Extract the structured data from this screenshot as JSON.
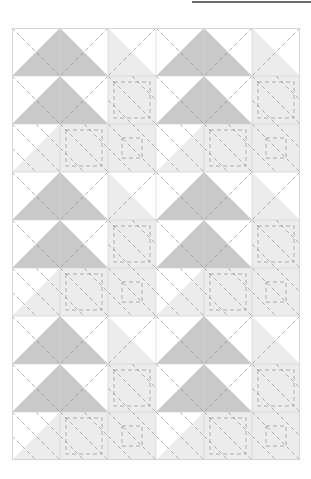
{
  "page": {
    "width": 311,
    "height": 479,
    "background": "#ffffff"
  },
  "top_rule": {
    "name": "horizontal-rule",
    "x": 192,
    "y": 1,
    "width": 119,
    "height": 2,
    "color": "#6b6b6b"
  },
  "quilt": {
    "title": "Half-Square Triangle Pinwheel Quilt Layout",
    "x": 12,
    "y": 28,
    "cell": 48,
    "cols": 6,
    "rows": 9,
    "width": 288,
    "height": 432,
    "border_color": "#d6d6d6",
    "border_width": 0.8,
    "colors": {
      "white": "#ffffff",
      "light": "#ececec",
      "medium": "#c9c9c9",
      "stitch": "#9a9a9a"
    },
    "stitch": {
      "dash": "4 3",
      "width": 0.9,
      "opacity": 0.85
    },
    "legend": {
      "white_label": "Background (white)",
      "light_label": "Light gray",
      "medium_label": "Medium gray"
    },
    "cells": [
      [
        "w|tr:m",
        "w|tl:m",
        "l|tl:l",
        "w|tr:m",
        "w|tl:m",
        "l|tl:l"
      ],
      [
        "w|br:m",
        "w|bl:m",
        "l|bl:l",
        "w|br:m",
        "w|bl:m",
        "l|bl:l"
      ],
      [
        "l|bl:l",
        "l|bl:l",
        "l|bl:l",
        "l|bl:l",
        "l|bl:l",
        "l|bl:l"
      ],
      [
        "w|tr:m",
        "w|tl:m",
        "l|tl:l",
        "w|tr:m",
        "w|tl:m",
        "l|tl:l"
      ],
      [
        "w|br:m",
        "w|bl:m",
        "l|bl:l",
        "w|br:m",
        "w|bl:m",
        "l|bl:l"
      ],
      [
        "l|bl:l",
        "l|bl:l",
        "l|bl:l",
        "l|bl:l",
        "l|bl:l",
        "l|bl:l"
      ],
      [
        "w|tr:m",
        "w|tl:m",
        "l|tl:l",
        "w|tr:m",
        "w|tl:m",
        "l|tl:l"
      ],
      [
        "w|br:m",
        "w|bl:m",
        "l|bl:l",
        "w|br:m",
        "w|bl:m",
        "l|bl:l"
      ],
      [
        "l|bl:l",
        "l|bl:l",
        "l|bl:l",
        "l|bl:l",
        "l|bl:l",
        "l|bl:l"
      ]
    ],
    "triangles": [
      {
        "row": 0,
        "col": 0,
        "corner": "br",
        "fill": "medium"
      },
      {
        "row": 0,
        "col": 1,
        "corner": "bl",
        "fill": "medium"
      },
      {
        "row": 0,
        "col": 2,
        "corner": "bl",
        "fill": "light"
      },
      {
        "row": 0,
        "col": 3,
        "corner": "br",
        "fill": "medium"
      },
      {
        "row": 0,
        "col": 4,
        "corner": "bl",
        "fill": "medium"
      },
      {
        "row": 0,
        "col": 5,
        "corner": "bl",
        "fill": "light"
      },
      {
        "row": 1,
        "col": 0,
        "corner": "br",
        "fill": "medium"
      },
      {
        "row": 1,
        "col": 1,
        "corner": "bl",
        "fill": "medium"
      },
      {
        "row": 1,
        "col": 2,
        "corner": "full",
        "fill": "light"
      },
      {
        "row": 1,
        "col": 3,
        "corner": "br",
        "fill": "medium"
      },
      {
        "row": 1,
        "col": 4,
        "corner": "bl",
        "fill": "medium"
      },
      {
        "row": 1,
        "col": 5,
        "corner": "full",
        "fill": "light"
      },
      {
        "row": 2,
        "col": 0,
        "corner": "br",
        "fill": "light"
      },
      {
        "row": 2,
        "col": 1,
        "corner": "full",
        "fill": "light"
      },
      {
        "row": 2,
        "col": 2,
        "corner": "full",
        "fill": "light"
      },
      {
        "row": 2,
        "col": 3,
        "corner": "br",
        "fill": "light"
      },
      {
        "row": 2,
        "col": 4,
        "corner": "full",
        "fill": "light"
      },
      {
        "row": 2,
        "col": 5,
        "corner": "full",
        "fill": "light"
      },
      {
        "row": 3,
        "col": 0,
        "corner": "br",
        "fill": "medium"
      },
      {
        "row": 3,
        "col": 1,
        "corner": "bl",
        "fill": "medium"
      },
      {
        "row": 3,
        "col": 2,
        "corner": "bl",
        "fill": "light"
      },
      {
        "row": 3,
        "col": 3,
        "corner": "br",
        "fill": "medium"
      },
      {
        "row": 3,
        "col": 4,
        "corner": "bl",
        "fill": "medium"
      },
      {
        "row": 3,
        "col": 5,
        "corner": "bl",
        "fill": "light"
      },
      {
        "row": 4,
        "col": 0,
        "corner": "br",
        "fill": "medium"
      },
      {
        "row": 4,
        "col": 1,
        "corner": "bl",
        "fill": "medium"
      },
      {
        "row": 4,
        "col": 2,
        "corner": "full",
        "fill": "light"
      },
      {
        "row": 4,
        "col": 3,
        "corner": "br",
        "fill": "medium"
      },
      {
        "row": 4,
        "col": 4,
        "corner": "bl",
        "fill": "medium"
      },
      {
        "row": 4,
        "col": 5,
        "corner": "full",
        "fill": "light"
      },
      {
        "row": 5,
        "col": 0,
        "corner": "br",
        "fill": "light"
      },
      {
        "row": 5,
        "col": 1,
        "corner": "full",
        "fill": "light"
      },
      {
        "row": 5,
        "col": 2,
        "corner": "full",
        "fill": "light"
      },
      {
        "row": 5,
        "col": 3,
        "corner": "br",
        "fill": "light"
      },
      {
        "row": 5,
        "col": 4,
        "corner": "full",
        "fill": "light"
      },
      {
        "row": 5,
        "col": 5,
        "corner": "full",
        "fill": "light"
      },
      {
        "row": 6,
        "col": 0,
        "corner": "br",
        "fill": "medium"
      },
      {
        "row": 6,
        "col": 1,
        "corner": "bl",
        "fill": "medium"
      },
      {
        "row": 6,
        "col": 2,
        "corner": "bl",
        "fill": "light"
      },
      {
        "row": 6,
        "col": 3,
        "corner": "br",
        "fill": "medium"
      },
      {
        "row": 6,
        "col": 4,
        "corner": "bl",
        "fill": "medium"
      },
      {
        "row": 6,
        "col": 5,
        "corner": "bl",
        "fill": "light"
      },
      {
        "row": 7,
        "col": 0,
        "corner": "br",
        "fill": "medium"
      },
      {
        "row": 7,
        "col": 1,
        "corner": "bl",
        "fill": "medium"
      },
      {
        "row": 7,
        "col": 2,
        "corner": "full",
        "fill": "light"
      },
      {
        "row": 7,
        "col": 3,
        "corner": "br",
        "fill": "medium"
      },
      {
        "row": 7,
        "col": 4,
        "corner": "bl",
        "fill": "medium"
      },
      {
        "row": 7,
        "col": 5,
        "corner": "full",
        "fill": "light"
      },
      {
        "row": 8,
        "col": 0,
        "corner": "br",
        "fill": "light"
      },
      {
        "row": 8,
        "col": 1,
        "corner": "full",
        "fill": "light"
      },
      {
        "row": 8,
        "col": 2,
        "corner": "full",
        "fill": "light"
      },
      {
        "row": 8,
        "col": 3,
        "corner": "br",
        "fill": "light"
      },
      {
        "row": 8,
        "col": 4,
        "corner": "full",
        "fill": "light"
      },
      {
        "row": 8,
        "col": 5,
        "corner": "full",
        "fill": "light"
      }
    ],
    "stitch_diagonals": [
      {
        "row": 0,
        "col": 0,
        "dir": "tlbr"
      },
      {
        "row": 0,
        "col": 1,
        "dir": "trbl"
      },
      {
        "row": 0,
        "col": 2,
        "dir": "trbl"
      },
      {
        "row": 0,
        "col": 3,
        "dir": "tlbr"
      },
      {
        "row": 0,
        "col": 4,
        "dir": "trbl"
      },
      {
        "row": 0,
        "col": 5,
        "dir": "trbl"
      },
      {
        "row": 1,
        "col": 0,
        "dir": "tlbr"
      },
      {
        "row": 1,
        "col": 1,
        "dir": "trbl"
      },
      {
        "row": 1,
        "col": 2,
        "dir": "tlbr"
      },
      {
        "row": 1,
        "col": 3,
        "dir": "tlbr"
      },
      {
        "row": 1,
        "col": 4,
        "dir": "trbl"
      },
      {
        "row": 1,
        "col": 5,
        "dir": "tlbr"
      },
      {
        "row": 2,
        "col": 0,
        "dir": "tlbr"
      },
      {
        "row": 2,
        "col": 1,
        "dir": "tlbr"
      },
      {
        "row": 2,
        "col": 2,
        "dir": "tlbr"
      },
      {
        "row": 2,
        "col": 3,
        "dir": "tlbr"
      },
      {
        "row": 2,
        "col": 4,
        "dir": "tlbr"
      },
      {
        "row": 2,
        "col": 5,
        "dir": "tlbr"
      }
    ],
    "stitch_boxes": [
      {
        "row": 1,
        "col": 2,
        "inset": 6
      },
      {
        "row": 1,
        "col": 5,
        "inset": 6
      },
      {
        "row": 2,
        "col": 1,
        "inset": 6
      },
      {
        "row": 2,
        "col": 2,
        "inset": 14
      },
      {
        "row": 2,
        "col": 4,
        "inset": 6
      },
      {
        "row": 2,
        "col": 5,
        "inset": 14
      },
      {
        "row": 4,
        "col": 2,
        "inset": 6
      },
      {
        "row": 4,
        "col": 5,
        "inset": 6
      },
      {
        "row": 5,
        "col": 1,
        "inset": 6
      },
      {
        "row": 5,
        "col": 2,
        "inset": 14
      },
      {
        "row": 5,
        "col": 4,
        "inset": 6
      },
      {
        "row": 5,
        "col": 5,
        "inset": 14
      },
      {
        "row": 7,
        "col": 2,
        "inset": 6
      },
      {
        "row": 7,
        "col": 5,
        "inset": 6
      },
      {
        "row": 8,
        "col": 1,
        "inset": 6
      },
      {
        "row": 8,
        "col": 2,
        "inset": 14
      },
      {
        "row": 8,
        "col": 4,
        "inset": 6
      },
      {
        "row": 8,
        "col": 5,
        "inset": 14
      }
    ]
  }
}
